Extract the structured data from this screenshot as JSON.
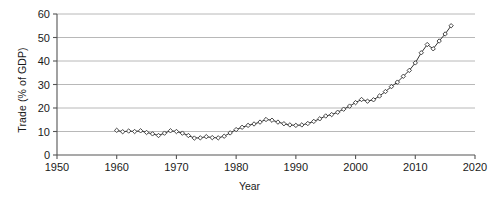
{
  "chart_data": {
    "type": "line",
    "title": "",
    "xlabel": "Year",
    "ylabel": "Trade (% of GDP)",
    "xlim": [
      1950,
      2020
    ],
    "ylim": [
      0,
      60
    ],
    "xticks": [
      1950,
      1960,
      1970,
      1980,
      1990,
      2000,
      2010,
      2020
    ],
    "yticks": [
      0,
      10,
      20,
      30,
      40,
      50,
      60
    ],
    "grid": "horizontal",
    "legend": "none",
    "marker": "open-diamond",
    "line_color": "#333333",
    "marker_fill": "#ffffff",
    "gridline_color": "#b0b0b0",
    "axis_color": "#555555",
    "series": [
      {
        "name": "Trade (% of GDP)",
        "x": [
          1960,
          1961,
          1962,
          1963,
          1964,
          1965,
          1966,
          1967,
          1968,
          1969,
          1970,
          1971,
          1972,
          1973,
          1974,
          1975,
          1976,
          1977,
          1978,
          1979,
          1980,
          1981,
          1982,
          1983,
          1984,
          1985,
          1986,
          1987,
          1988,
          1989,
          1990,
          1991,
          1992,
          1993,
          1994,
          1995,
          1996,
          1997,
          1998,
          1999,
          2000,
          2001,
          2002,
          2003,
          2004,
          2005,
          2006,
          2007,
          2008,
          2009,
          2010,
          2011,
          2012,
          2013,
          2014,
          2015,
          2016
        ],
        "values": [
          10.5,
          9.9,
          10.2,
          10.0,
          10.3,
          9.6,
          9.0,
          8.3,
          9.3,
          10.3,
          10.0,
          9.3,
          8.3,
          7.2,
          7.3,
          7.8,
          7.4,
          7.3,
          8.0,
          9.4,
          10.8,
          11.8,
          12.6,
          13.2,
          14.0,
          15.1,
          14.8,
          14.0,
          13.3,
          12.8,
          12.6,
          12.8,
          13.4,
          14.3,
          15.4,
          16.6,
          17.2,
          18.2,
          19.5,
          20.8,
          22.3,
          23.6,
          22.9,
          23.5,
          25.1,
          27.0,
          29.1,
          31.0,
          33.5,
          36.0,
          39.2,
          43.5,
          47.0,
          45.2,
          48.5,
          51.5,
          55.0
        ]
      }
    ]
  }
}
